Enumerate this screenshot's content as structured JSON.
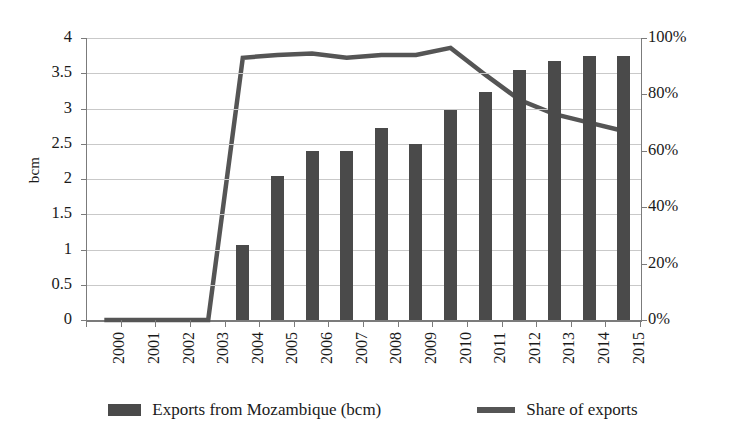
{
  "chart_data": {
    "type": "bar",
    "title": "",
    "subtitle": "",
    "xlabel": "",
    "ylabel": "bcm",
    "y2label": "",
    "grid": true,
    "legend_position": "bottom",
    "categories": [
      "2000",
      "2001",
      "2002",
      "2003",
      "2004",
      "2005",
      "2006",
      "2007",
      "2008",
      "2009",
      "2010",
      "2011",
      "2012",
      "2013",
      "2014",
      "2015"
    ],
    "ylim": [
      0,
      4
    ],
    "yticks": [
      "0",
      "0.5",
      "1",
      "1.5",
      "2",
      "2.5",
      "3",
      "3.5",
      "4"
    ],
    "ytick_values": [
      0,
      0.5,
      1,
      1.5,
      2,
      2.5,
      3,
      3.5,
      4
    ],
    "y2lim": [
      0,
      100
    ],
    "y2ticks": [
      "0%",
      "20%",
      "40%",
      "60%",
      "80%",
      "100%"
    ],
    "y2tick_values": [
      0,
      20,
      40,
      60,
      80,
      100
    ],
    "series": [
      {
        "name": "Exports from Mozambique (bcm)",
        "type": "bar",
        "axis": "left",
        "color": "#4a4a4a",
        "values": [
          0,
          0,
          0,
          0,
          1.06,
          2.04,
          2.4,
          2.4,
          2.72,
          2.49,
          2.98,
          3.24,
          3.55,
          3.67,
          3.74,
          3.75
        ]
      },
      {
        "name": "Share of exports",
        "type": "line",
        "axis": "right",
        "color": "#555555",
        "values": [
          0,
          0,
          0,
          0,
          93,
          94,
          94.5,
          93,
          94,
          94,
          96.5,
          87,
          78,
          73,
          70,
          67
        ]
      }
    ]
  },
  "legend": {
    "items": [
      {
        "label": "Exports from Mozambique (bcm)",
        "marker": "bar-swatch"
      },
      {
        "label": "Share of exports",
        "marker": "line-swatch"
      }
    ]
  },
  "colors": {
    "bar": "#4a4a4a",
    "line": "#555555",
    "grid": "#c9c9c9",
    "axis": "#7b7b7b",
    "text": "#1a1a1a",
    "background": "#ffffff"
  }
}
